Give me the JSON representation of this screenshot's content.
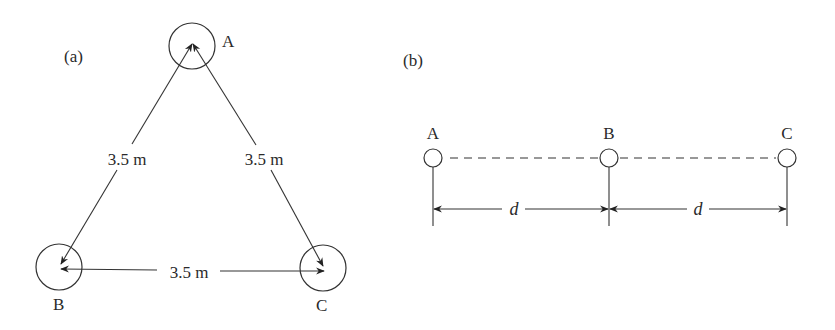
{
  "panel_a": {
    "label": "(a)",
    "nodes": [
      {
        "id": "A",
        "label": "A",
        "cx": 192,
        "cy": 46,
        "r": 23
      },
      {
        "id": "B",
        "label": "B",
        "cx": 59,
        "cy": 267,
        "r": 23
      },
      {
        "id": "C",
        "label": "C",
        "cx": 323,
        "cy": 268,
        "r": 23
      }
    ],
    "edges": [
      {
        "from": "A",
        "to": "B",
        "label": "3.5 m"
      },
      {
        "from": "A",
        "to": "C",
        "label": "3.5 m"
      },
      {
        "from": "B",
        "to": "C",
        "label": "3.5 m"
      }
    ]
  },
  "panel_b": {
    "label": "(b)",
    "nodes": [
      {
        "id": "A",
        "label": "A",
        "cx": 433,
        "cy": 158,
        "r": 9
      },
      {
        "id": "B",
        "label": "B",
        "cx": 609,
        "cy": 158,
        "r": 9
      },
      {
        "id": "C",
        "label": "C",
        "cx": 787,
        "cy": 158,
        "r": 9
      }
    ],
    "spacings": [
      {
        "from": "A",
        "to": "B",
        "label": "d"
      },
      {
        "from": "B",
        "to": "C",
        "label": "d"
      }
    ]
  },
  "colors": {
    "stroke": "#333333",
    "text": "#2a2a2a",
    "background": "#ffffff"
  }
}
